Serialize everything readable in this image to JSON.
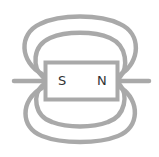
{
  "diagram": {
    "magnet": {
      "left_pole_label": "S",
      "right_pole_label": "N"
    },
    "colors": {
      "field_line": "#a9a9a9",
      "magnet_border": "#a9a9a9",
      "magnet_fill": "#ffffff",
      "label": "#333333",
      "background": "#ffffff"
    }
  }
}
